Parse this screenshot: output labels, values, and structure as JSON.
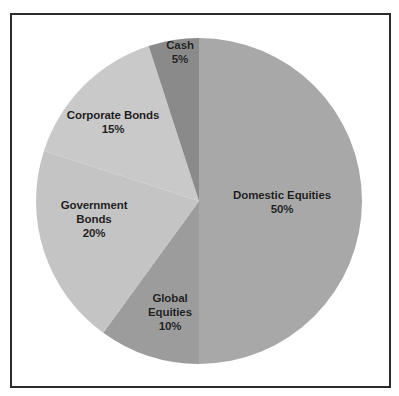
{
  "figure": {
    "background_color": "#ffffff",
    "frame_color": "#2b2b2b",
    "label_text_color": "#1d1d1d"
  },
  "chart_data": {
    "type": "pie",
    "title": "",
    "subtitle": "",
    "xlabel": "",
    "ylabel": "",
    "grid": false,
    "legend_position": "none",
    "label_style": "inside-slice",
    "start_angle_deg": 0,
    "direction": "clockwise",
    "units": "percent",
    "total": 100,
    "categories": [
      "Domestic Equities",
      "Global Equities",
      "Government Bonds",
      "Corporate Bonds",
      "Cash"
    ],
    "values": [
      50,
      10,
      20,
      15,
      5
    ],
    "value_labels": [
      "50%",
      "10%",
      "20%",
      "15%",
      "5%"
    ],
    "colors": [
      "#a8a8a8",
      "#9c9c9c",
      "#c4c4c4",
      "#c9c9c9",
      "#8a8a8a"
    ],
    "slices": [
      {
        "name": "Domestic Equities",
        "label_line1": "Domestic Equities",
        "label_line2": "50%",
        "label": "Domestic Equities\n50%",
        "value": 50,
        "value_label": "50%",
        "color": "#a8a8a8",
        "start_angle_deg": 0,
        "end_angle_deg": 180
      },
      {
        "name": "Global Equities",
        "label_line1": "Global",
        "label_line2": "Equities",
        "label_line3": "10%",
        "label": "Global\nEquities\n10%",
        "value": 10,
        "value_label": "10%",
        "color": "#9c9c9c",
        "start_angle_deg": 180,
        "end_angle_deg": 216
      },
      {
        "name": "Government Bonds",
        "label_line1": "Government",
        "label_line2": "Bonds",
        "label_line3": "20%",
        "label": "Government\nBonds\n20%",
        "value": 20,
        "value_label": "20%",
        "color": "#c4c4c4",
        "start_angle_deg": 216,
        "end_angle_deg": 288
      },
      {
        "name": "Corporate Bonds",
        "label_line1": "Corporate Bonds",
        "label_line2": "15%",
        "label": "Corporate Bonds\n15%",
        "value": 15,
        "value_label": "15%",
        "color": "#c9c9c9",
        "start_angle_deg": 288,
        "end_angle_deg": 342
      },
      {
        "name": "Cash",
        "label_line1": "Cash",
        "label_line2": "5%",
        "label": "Cash\n5%",
        "value": 5,
        "value_label": "5%",
        "color": "#8a8a8a",
        "start_angle_deg": 342,
        "end_angle_deg": 360
      }
    ]
  }
}
